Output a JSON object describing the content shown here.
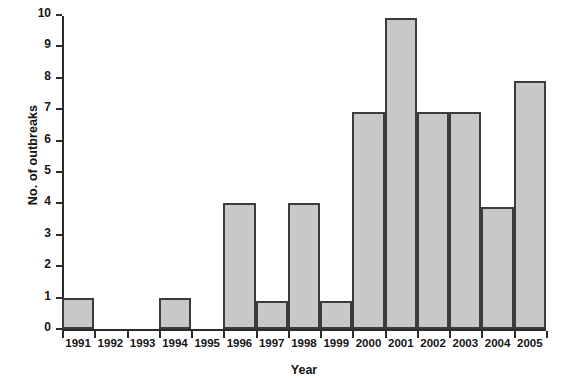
{
  "chart_data": {
    "type": "bar",
    "title": "",
    "xlabel": "Year",
    "ylabel": "No. of outbreaks",
    "categories": [
      "1991",
      "1992",
      "1993",
      "1994",
      "1995",
      "1996",
      "1997",
      "1998",
      "1999",
      "2000",
      "2001",
      "2002",
      "2003",
      "2004",
      "2005"
    ],
    "values": [
      1,
      0,
      0,
      1,
      0,
      4,
      0.9,
      4,
      0.9,
      6.9,
      9.9,
      6.9,
      6.9,
      3.9,
      7.9
    ],
    "ylim": [
      0,
      10
    ],
    "xlim_categories": 15,
    "ytick_labels": [
      "0",
      "1",
      "2",
      "3",
      "4",
      "5",
      "6",
      "7",
      "8",
      "9",
      "10"
    ],
    "ytick_values": [
      0,
      1,
      2,
      3,
      4,
      5,
      6,
      7,
      8,
      9,
      10
    ],
    "grid": false,
    "legend": null,
    "bar_fill_color": "#c8c8c8",
    "bar_border_color": "#3c3c3c",
    "axis_color": "#2b2b2b",
    "background_color": "#ffffff",
    "bar_gap": 0
  }
}
